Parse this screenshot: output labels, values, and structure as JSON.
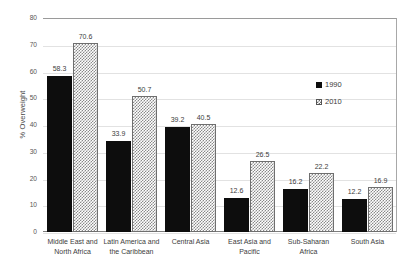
{
  "chart_data": {
    "type": "bar",
    "title": "",
    "subtitle": "",
    "xlabel": "",
    "ylabel": "% Overweight",
    "ylim": [
      0,
      80
    ],
    "ytick_step": 10,
    "yticks": [
      "80",
      "70",
      "60",
      "50",
      "40",
      "30",
      "20",
      "10",
      "0"
    ],
    "grid": true,
    "legend_position": "inside-right",
    "categories": [
      "Middle East and North Africa",
      "Latin America and the Caribbean",
      "Central Asia",
      "East Asia and Pacific",
      "Sub-Saharan Africa",
      "South Asia"
    ],
    "category_lines": [
      [
        "Middle East and",
        "North Africa"
      ],
      [
        "Latin America and",
        "the Caribbean"
      ],
      [
        "Central Asia",
        ""
      ],
      [
        "East Asia and",
        "Pacific"
      ],
      [
        "Sub-Saharan",
        "Africa"
      ],
      [
        "South Asia",
        ""
      ]
    ],
    "series": [
      {
        "name": "1990",
        "color": "#0d0d0d",
        "pattern": "solid",
        "values": [
          58.3,
          33.9,
          39.2,
          12.6,
          16.2,
          12.2
        ],
        "labels": [
          "58.3",
          "33.9",
          "39.2",
          "12.6",
          "16.2",
          "12.2"
        ]
      },
      {
        "name": "2010",
        "color": "#8a8a8a",
        "pattern": "checker",
        "values": [
          70.6,
          50.7,
          40.5,
          26.5,
          22.2,
          16.9
        ],
        "labels": [
          "70.6",
          "50.7",
          "40.5",
          "26.5",
          "22.2",
          "16.9"
        ]
      }
    ]
  },
  "legend": {
    "entries": [
      {
        "label": "1990"
      },
      {
        "label": "2010"
      }
    ]
  }
}
